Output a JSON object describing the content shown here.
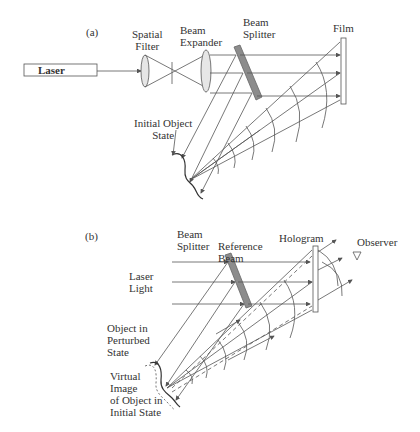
{
  "panel_a": {
    "tag": "(a)",
    "laser": "Laser",
    "spatial_filter": [
      "Spatial",
      "Filter"
    ],
    "beam_expander": [
      "Beam",
      "Expander"
    ],
    "beam_splitter": [
      "Beam",
      "Splitter"
    ],
    "film": "Film",
    "initial_object_state": [
      "Initial Object",
      "State"
    ]
  },
  "panel_b": {
    "tag": "(b)",
    "beam_splitter": [
      "Beam",
      "Splitter"
    ],
    "reference_beam": [
      "Reference",
      "Beam"
    ],
    "hologram": "Hologram",
    "observer": "Observer",
    "laser_light": [
      "Laser",
      "Light"
    ],
    "object_perturbed": [
      "Object in",
      "Perturbed",
      "State"
    ],
    "virtual_image": [
      "Virtual",
      "Image",
      "of Object in",
      "Initial State"
    ]
  },
  "colors": {
    "line": "#555555",
    "splitter": "#8c8c8c",
    "lens_fill": "#e6e6e6",
    "text": "#333333"
  }
}
